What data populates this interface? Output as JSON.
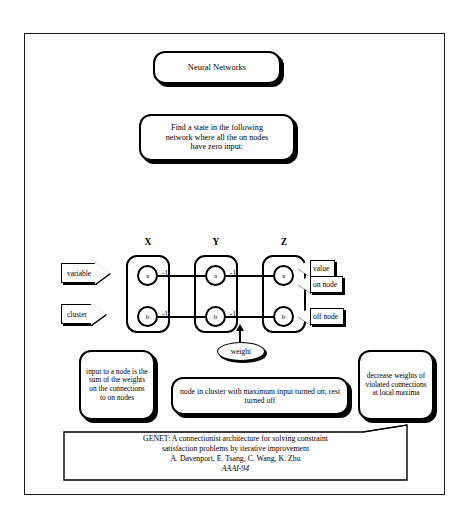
{
  "slide": {
    "title_box": {
      "text": "Neural Networks"
    },
    "problem_box": {
      "line1": "Find a state in the following",
      "line2": "network where all the on nodes",
      "line3": "have zero input:"
    },
    "network": {
      "column_labels": [
        "X",
        "Y",
        "Z"
      ],
      "clusters": [
        {
          "name": "X",
          "nodes": [
            {
              "label": "a",
              "state": "on"
            },
            {
              "label": "b",
              "state": "off"
            }
          ]
        },
        {
          "name": "Y",
          "nodes": [
            {
              "label": "a",
              "state": "on"
            },
            {
              "label": "b",
              "state": "off"
            }
          ]
        },
        {
          "name": "Z",
          "nodes": [
            {
              "label": "a",
              "state": "on"
            },
            {
              "label": "b",
              "state": "off"
            }
          ]
        }
      ],
      "connections": [
        {
          "from": "X.a",
          "to": "Y.a",
          "weight": "-1"
        },
        {
          "from": "Y.a",
          "to": "Z.a",
          "weight": "-1"
        },
        {
          "from": "X.b",
          "to": "Y.b",
          "weight": "-1"
        },
        {
          "from": "Y.b",
          "to": "Z.b",
          "weight": "-1"
        }
      ],
      "callouts": {
        "variable": "variable",
        "cluster": "cluster",
        "value": "value",
        "on_node": "on node",
        "off_node": "off node",
        "weight": "weight"
      }
    },
    "notes": {
      "left": "input to a node is the sum of the weights on the connections to on nodes",
      "middle": "node in cluster with maximum input turned on; rest turned off",
      "right": "decrease weights of violated connections at local maxima"
    },
    "citation": {
      "title_line1": "GENET: A connectionist architecture for solving constraint",
      "title_line2": "satisfaction problems by iterative improvement",
      "authors": "A. Davenport, E. Tsang, C. Wang, K. Zhu",
      "venue": "AAAI-94"
    }
  }
}
